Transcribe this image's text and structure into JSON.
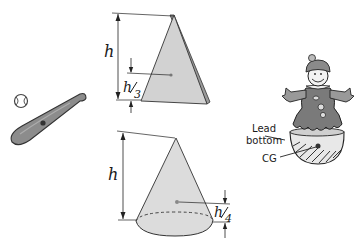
{
  "diagram": {
    "triangle": {
      "height_label": "h",
      "cg_label_num": "h",
      "cg_label_den": "3"
    },
    "cone": {
      "height_label": "h",
      "cg_label_num": "h",
      "cg_label_den": "4"
    },
    "toy": {
      "lead_label_line1": "Lead",
      "lead_label_line2": "bottom",
      "cg_label": "CG"
    },
    "colors": {
      "shape_fill": "#d4d4d4",
      "shape_dark": "#8a8a8a",
      "line": "#222222",
      "toy_body": "#7a7a7a"
    }
  }
}
